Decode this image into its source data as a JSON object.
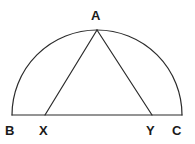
{
  "figure": {
    "kind": "geometry-diagram",
    "background_color": "#ffffff",
    "stroke_color": "#2b2b2b",
    "label_color": "#1a1a1a",
    "stroke_width": 1.2,
    "canvas": {
      "width": 195,
      "height": 144
    }
  },
  "labels": {
    "apex": "A",
    "left_end": "B",
    "left_foot": "X",
    "right_foot": "Y",
    "right_end": "C"
  },
  "chart_data": {
    "type": "scatter",
    "title": "",
    "xlabel": "",
    "ylabel": "",
    "points": [
      {
        "name": "A",
        "x": 97,
        "y": 30
      },
      {
        "name": "B",
        "x": 12,
        "y": 115
      },
      {
        "name": "X",
        "x": 45,
        "y": 115
      },
      {
        "name": "Y",
        "x": 152,
        "y": 115
      },
      {
        "name": "C",
        "x": 182,
        "y": 115
      }
    ],
    "shapes": {
      "semicircle": {
        "center_x": 97,
        "center_y": 115,
        "radius": 85,
        "from": "B",
        "to": "C"
      },
      "diameter": {
        "from": "B",
        "to": "C"
      },
      "triangle_sides": [
        {
          "from": "A",
          "to": "X"
        },
        {
          "from": "A",
          "to": "Y"
        }
      ]
    },
    "grid": false,
    "legend": "none"
  },
  "paths": {
    "arc": "M 12 115 A 85 85 0 0 1 182 115",
    "baseline": "M 12 115 L 182 115",
    "side_ax": "M 97 30 L 45 115",
    "side_ay": "M 97 30 L 152 115"
  }
}
